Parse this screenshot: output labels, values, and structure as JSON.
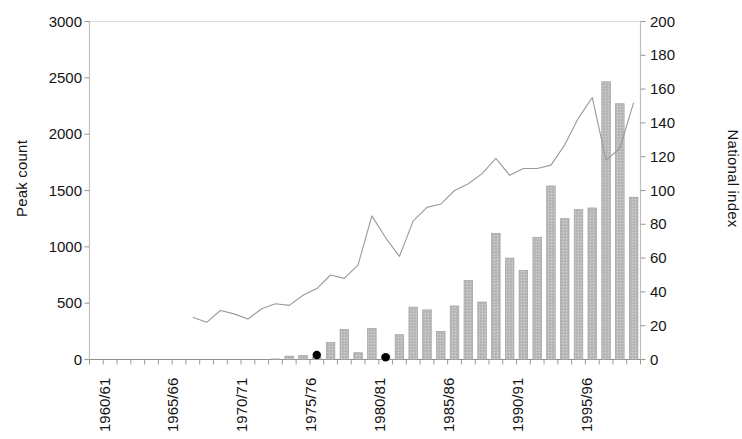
{
  "chart_data": {
    "type": "bar",
    "title": "",
    "xlabel": "",
    "ylabel": "Peak count",
    "y2label": "National index",
    "ylim": [
      0,
      3000
    ],
    "ylim_right": [
      0,
      200
    ],
    "ytick_step": 500,
    "ytick_step_right": 20,
    "grid": false,
    "legend": "none",
    "categories": [
      "1960/61",
      "1961/62",
      "1962/63",
      "1963/64",
      "1964/65",
      "1965/66",
      "1966/67",
      "1967/68",
      "1968/69",
      "1969/70",
      "1970/71",
      "1971/72",
      "1972/73",
      "1973/74",
      "1974/75",
      "1975/76",
      "1976/77",
      "1977/78",
      "1978/79",
      "1979/80",
      "1980/81",
      "1981/82",
      "1982/83",
      "1983/84",
      "1984/85",
      "1985/86",
      "1986/87",
      "1987/88",
      "1988/89",
      "1989/90",
      "1990/91",
      "1991/92",
      "1992/93",
      "1993/94",
      "1994/95",
      "1995/96",
      "1996/97",
      "1997/98",
      "1998/99",
      "1999/00"
    ],
    "yticks": [
      0,
      500,
      1000,
      1500,
      2000,
      2500,
      3000
    ],
    "yticks_right": [
      0,
      20,
      40,
      60,
      80,
      100,
      120,
      140,
      160,
      180,
      200
    ],
    "xtick_labels_shown": [
      "1960/61",
      "1965/66",
      "1970/71",
      "1975/76",
      "1980/81",
      "1985/86",
      "1990/91",
      "1995/96"
    ],
    "series": [
      {
        "name": "Peak count",
        "type": "bar",
        "axis": "left",
        "color": "#b5b5b5",
        "values": [
          0,
          0,
          0,
          0,
          0,
          0,
          0,
          0,
          0,
          0,
          0,
          0,
          0,
          5,
          30,
          35,
          20,
          150,
          265,
          60,
          275,
          35,
          220,
          465,
          440,
          250,
          475,
          700,
          510,
          1120,
          900,
          790,
          1085,
          1540,
          1250,
          1330,
          1345,
          2465,
          2270,
          1440
        ]
      },
      {
        "name": "National index",
        "type": "line",
        "axis": "right",
        "color": "#9a9a9a",
        "start_category_index": 7,
        "values": [
          25,
          22,
          29,
          27,
          24,
          30,
          33,
          32,
          38,
          42,
          50,
          48,
          56,
          85,
          72,
          61,
          82,
          90,
          92,
          100,
          104,
          110,
          119,
          109,
          113,
          113,
          115,
          127,
          143,
          155,
          118,
          125,
          152,
          118,
          100,
          97,
          102,
          109,
          88,
          97
        ]
      }
    ],
    "point_markers": [
      {
        "category": "1976/77",
        "value": 40,
        "color": "#000000"
      },
      {
        "category": "1981/82",
        "value": 20,
        "color": "#000000"
      }
    ]
  }
}
